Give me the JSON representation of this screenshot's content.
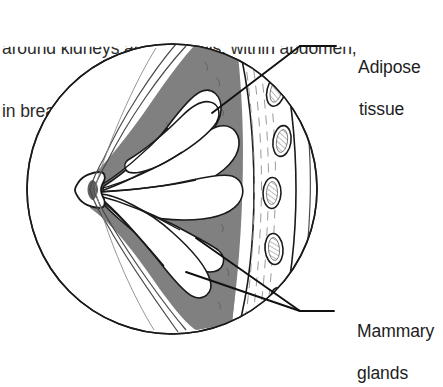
{
  "figure": {
    "kind": "anatomical-cross-section",
    "caption": {
      "line1": "around kidneys and eyeballs, within abdomen,",
      "line2": "in breasts."
    },
    "labels": {
      "adipose": {
        "name": "adipose-tissue",
        "line1": "Adipose",
        "line2": "tissue"
      },
      "mammary": {
        "name": "mammary-glands",
        "line1": "Mammary",
        "line2": "glands"
      }
    },
    "colors": {
      "adipose_fill": "#808080",
      "gland_fill": "#ffffff",
      "outline": "#1a1a1a",
      "skin_line": "#555555",
      "rib_outline": "#2b2b2b",
      "muscle_stripe": "#9a9a9a",
      "background": "#ffffff"
    },
    "circle": {
      "cx": 172,
      "cy": 189,
      "r": 146
    },
    "structures": [
      "skin",
      "nipple",
      "lactiferous-duct",
      "mammary-lobule",
      "adipose-tissue",
      "pectoral-muscle",
      "rib"
    ],
    "rib_count": 5
  }
}
